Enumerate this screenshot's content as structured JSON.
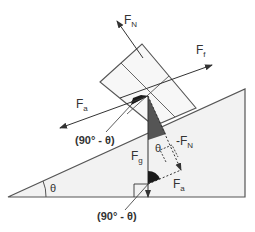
{
  "diagram": {
    "colors": {
      "line": "#555555",
      "incline_fill": "#f2f2f2",
      "block_fill": "#f7f7f7",
      "dark_angle": "#1a1a1a",
      "gray_angle": "#555555"
    },
    "labels": {
      "normal_force": {
        "main": "F",
        "sub": "N"
      },
      "friction_force": {
        "main": "F",
        "sub": "f"
      },
      "applied_force": {
        "main": "F",
        "sub": "a"
      },
      "gravity_force": {
        "main": "F",
        "sub": "g"
      },
      "neg_normal_force": {
        "main": "-F",
        "sub": "N"
      },
      "applied_component": {
        "main": "F",
        "sub": "a"
      },
      "angle_upper": "(90° - θ)",
      "angle_lower": "(90° - θ)",
      "theta_incline": "θ",
      "theta_block": "θ"
    }
  }
}
